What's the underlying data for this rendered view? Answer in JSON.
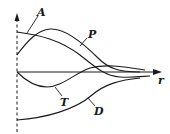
{
  "diagram": {
    "axis_label": "r",
    "curves": [
      {
        "id": "A",
        "label": "A"
      },
      {
        "id": "P",
        "label": "P"
      },
      {
        "id": "T",
        "label": "T"
      },
      {
        "id": "D",
        "label": "D"
      }
    ],
    "colors": {
      "ink": "#1a1a1a",
      "background": "#ffffff"
    }
  }
}
